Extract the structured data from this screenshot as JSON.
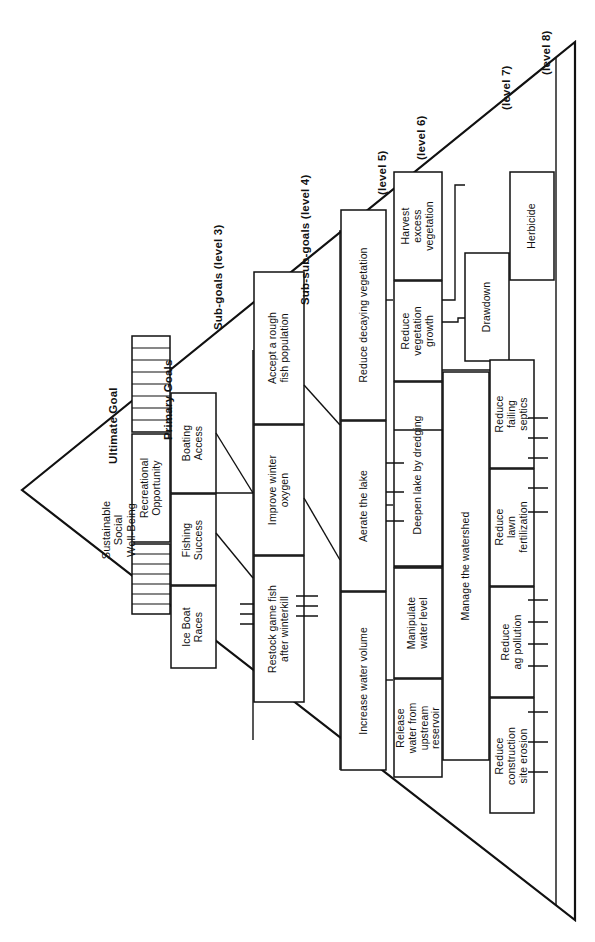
{
  "diagram": {
    "shape": "triangle",
    "stroke_color": "#111111",
    "background_color": "#ffffff"
  },
  "headers": [
    {
      "id": "h1",
      "label": "Ultimate Goal"
    },
    {
      "id": "h2",
      "label": "Primary Goals"
    },
    {
      "id": "h3",
      "label": "Sub-goals (level 3)"
    },
    {
      "id": "h4",
      "label": "Sub-sub-goals (level 4)"
    },
    {
      "id": "h5",
      "label": "(level 5)"
    },
    {
      "id": "h6",
      "label": "(level 6)"
    },
    {
      "id": "h7",
      "label": "(level 7)"
    },
    {
      "id": "h8",
      "label": "(level 8)"
    }
  ],
  "levels": {
    "level1": {
      "name": "Ultimate Goal",
      "nodes": [
        {
          "id": "n-ultimate",
          "label": "Sustainable\nSocial\nWell-Being"
        }
      ]
    },
    "level2": {
      "name": "Primary Goals",
      "nodes": [
        {
          "id": "n-recreational",
          "label": "Recreational\nOpportunity"
        }
      ]
    },
    "level3": {
      "name": "Sub-goals (level 3)",
      "nodes": [
        {
          "id": "n-boating",
          "label": "Boating\nAccess"
        },
        {
          "id": "n-fishing",
          "label": "Fishing\nSuccess"
        },
        {
          "id": "n-iceboat",
          "label": "Ice Boat\nRaces"
        }
      ]
    },
    "level4": {
      "name": "Sub-sub-goals (level 4)",
      "nodes": [
        {
          "id": "n-roughfish",
          "label": "Accept a rough\nfish population"
        },
        {
          "id": "n-winteroxygen",
          "label": "Improve winter\noxygen"
        },
        {
          "id": "n-restock",
          "label": "Restock game fish\nafter winterkill"
        }
      ]
    },
    "level5": {
      "name": "(level 5)",
      "nodes": [
        {
          "id": "n-decaying",
          "label": "Reduce decaying vegetation"
        },
        {
          "id": "n-aerate",
          "label": "Aerate the lake"
        },
        {
          "id": "n-watervolume",
          "label": "Increase water volume"
        }
      ]
    },
    "level6": {
      "name": "(level 6)",
      "nodes": [
        {
          "id": "n-harvest",
          "label": "Harvest\nexcess\nvegetation"
        },
        {
          "id": "n-vegetationgrowth",
          "label": "Reduce\nvegetation\ngrowth"
        },
        {
          "id": "n-dredging",
          "label": "Deepen lake by dredging"
        },
        {
          "id": "n-manipulate",
          "label": "Manipulate\nwater level"
        },
        {
          "id": "n-release",
          "label": "Release\nwater from\nupstream\nreservoir"
        }
      ]
    },
    "level7": {
      "name": "(level 7)",
      "nodes": [
        {
          "id": "n-drawdown",
          "label": "Drawdown"
        },
        {
          "id": "n-watershed",
          "label": "Manage the watershed"
        },
        {
          "id": "n-septics",
          "label": "Reduce\nfailing\nseptics"
        },
        {
          "id": "n-lawn",
          "label": "Reduce\nlawn\nfertilization"
        },
        {
          "id": "n-agpollution",
          "label": "Reduce\nag pollution"
        },
        {
          "id": "n-erosion",
          "label": "Reduce\nconstruction\nsite erosion"
        }
      ]
    },
    "level8": {
      "name": "(level 8)",
      "nodes": [
        {
          "id": "n-herbicide",
          "label": "Herbicide"
        }
      ]
    }
  }
}
